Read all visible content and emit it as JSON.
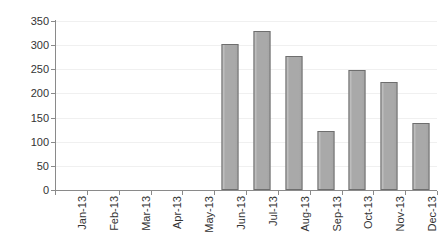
{
  "chart_data": {
    "type": "bar",
    "title": "",
    "subtitle": "",
    "xlabel": "",
    "ylabel": "",
    "categories": [
      "Jan-13",
      "Feb-13",
      "Mar-13",
      "Apr-13",
      "May-13",
      "Jun-13",
      "Jul-13",
      "Aug-13",
      "Sep-13",
      "Oct-13",
      "Nov-13",
      "Dec-13"
    ],
    "values": [
      0,
      0,
      0,
      0,
      0,
      303,
      329,
      277,
      122,
      249,
      224,
      139
    ],
    "series": [
      {
        "name": "",
        "values": [
          0,
          0,
          0,
          0,
          0,
          303,
          329,
          277,
          122,
          249,
          224,
          139
        ]
      }
    ],
    "ylim": [
      0,
      350
    ],
    "ytick_values": [
      0,
      50,
      100,
      150,
      200,
      250,
      300,
      350
    ],
    "ytick_labels": [
      "0",
      "50",
      "100",
      "150",
      "200",
      "250",
      "300",
      "350"
    ],
    "ytick_step": 50,
    "grid": true,
    "grid_axis": "y",
    "legend": false,
    "legend_position": "none",
    "annotations": [],
    "xtick_rotation": -90,
    "bar_color": "#a9a9a9",
    "bar_border_color": "#6e6e6e",
    "gridline_color": "#f0f0f0",
    "axis_color": "#8a8a8a",
    "text_color": "#333333",
    "background_color": "#ffffff"
  }
}
